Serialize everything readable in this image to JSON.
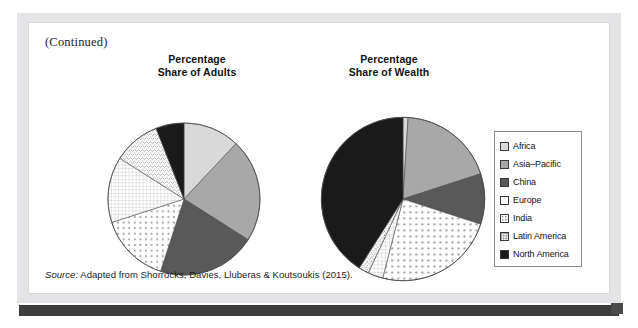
{
  "figure": {
    "continued_label": "(Continued)",
    "source_prefix": "Source:",
    "source_text": "Adapted from Shorrocks, Davies, Lluberas & Koutsoukis (2015)."
  },
  "legend": {
    "items": [
      {
        "label": "Africa",
        "pattern": "light-gray",
        "color": "#d9d9d9"
      },
      {
        "label": "Asia–Pacific",
        "pattern": "mid-gray",
        "color": "#a8a8a8"
      },
      {
        "label": "China",
        "pattern": "dark-gray",
        "color": "#595959"
      },
      {
        "label": "Europe",
        "pattern": "fine-stipple",
        "color": "#ffffff"
      },
      {
        "label": "India",
        "pattern": "dotted",
        "color": "#ffffff"
      },
      {
        "label": "Latin America",
        "pattern": "grid",
        "color": "#ffffff"
      },
      {
        "label": "North America",
        "pattern": "black",
        "color": "#1a1a1a"
      }
    ]
  },
  "chart_data": [
    {
      "type": "pie",
      "id": "share-of-adults",
      "title": "Percentage\nShare of Adults",
      "title_line1": "Percentage",
      "title_line2": "Share of Adults",
      "categories": [
        "Africa",
        "Asia–Pacific",
        "China",
        "India",
        "Latin America",
        "Europe",
        "North America"
      ],
      "values": [
        12,
        22,
        21,
        15,
        14,
        10,
        6
      ],
      "units": "percent",
      "start_angle_deg": 0,
      "direction": "clockwise",
      "legend_position": "right"
    },
    {
      "type": "pie",
      "id": "share-of-wealth",
      "title": "Percentage\nShare of Wealth",
      "title_line1": "Percentage",
      "title_line2": "Share of Wealth",
      "categories": [
        "Africa",
        "Asia–Pacific",
        "China",
        "India",
        "Latin America",
        "Europe",
        "North America"
      ],
      "values": [
        1,
        19,
        10,
        24,
        3,
        2,
        41
      ],
      "units": "percent",
      "start_angle_deg": 0,
      "direction": "clockwise",
      "legend_position": "right"
    }
  ]
}
